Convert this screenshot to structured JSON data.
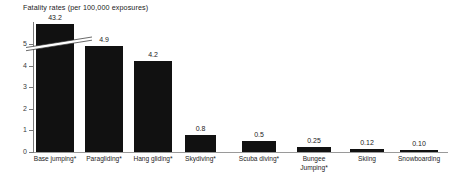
{
  "chart_data": {
    "type": "bar",
    "title": "Fatality rates (per 100,000 exposures)",
    "xlabel": "",
    "ylabel": "",
    "ylim": [
      0,
      5.6
    ],
    "yticks": [
      "0",
      "1",
      "2",
      "3",
      "4",
      "5"
    ],
    "grid": false,
    "legend": null,
    "axis_break": {
      "present": true,
      "at_value": 5.2,
      "note": "first bar truncated; true value 43.2"
    },
    "categories": [
      "Base jumping*",
      "Paragliding*",
      "Hang gliding*",
      "Skydiving*",
      "Scuba diving*",
      "Bungee\nJumping*",
      "Skiing",
      "Snowboarding"
    ],
    "values": [
      43.2,
      4.9,
      4.2,
      0.8,
      0.5,
      0.25,
      0.12,
      0.1
    ],
    "value_labels": [
      "43.2",
      "4.9",
      "4.2",
      "0.8",
      "0.5",
      "0.25",
      "0.12",
      "0.10"
    ],
    "bar_color": "#111111"
  },
  "axis": {
    "tick_0": "0",
    "tick_1": "1",
    "tick_2": "2",
    "tick_3": "3",
    "tick_4": "4",
    "tick_5": "5"
  }
}
